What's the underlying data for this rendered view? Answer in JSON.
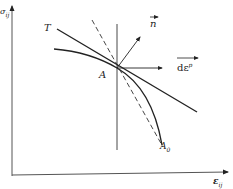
{
  "diagram": {
    "axes": {
      "y_label": "σ_ij",
      "x_label": "ε_ij"
    },
    "labels": {
      "T": "T",
      "A": "A",
      "A0": "A",
      "A0_sub": "0",
      "n": "n",
      "de_p": "dε",
      "de_p_sup": "p",
      "x_axis_main": "ε",
      "x_axis_sub": "ij",
      "y_axis_main": "σ",
      "y_axis_sub": "ij"
    },
    "colors": {
      "line": "#222222",
      "axis": "#444444",
      "background": "#ffffff"
    }
  }
}
